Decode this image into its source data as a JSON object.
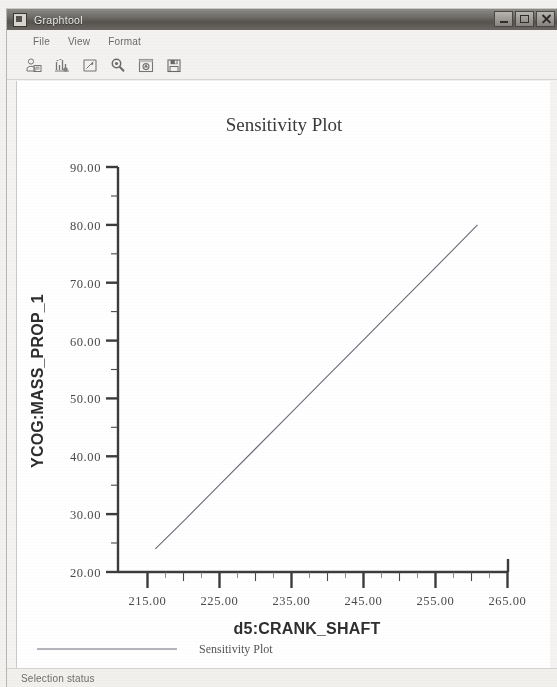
{
  "window": {
    "title": "Graphtool",
    "icon": "app-icon",
    "controls": [
      {
        "name": "minimize",
        "glyph": "minimize-icon"
      },
      {
        "name": "maximize",
        "glyph": "maximize-icon"
      },
      {
        "name": "close",
        "glyph": "close-icon"
      }
    ]
  },
  "menubar": {
    "items": [
      {
        "label": "File"
      },
      {
        "label": "View"
      },
      {
        "label": "Format"
      }
    ]
  },
  "toolbar": {
    "buttons": [
      {
        "name": "print-preview-icon",
        "tip": "Print"
      },
      {
        "name": "chart-settings-icon",
        "tip": "Chart Settings"
      },
      {
        "name": "page-icon",
        "tip": "Page"
      },
      {
        "name": "zoom-icon",
        "tip": "Zoom"
      },
      {
        "name": "snapshot-icon",
        "tip": "Snapshot"
      },
      {
        "name": "save-icon",
        "tip": "Save"
      }
    ]
  },
  "statusbar": {
    "text": "Selection status"
  },
  "chart_data": {
    "type": "line",
    "title": "Sensitivity Plot",
    "xlabel": "d5:CRANK_SHAFT",
    "ylabel": "YCOG:MASS_PROP_1",
    "xlim": [
      210,
      267.5
    ],
    "ylim": [
      20,
      90
    ],
    "xticks": [
      215,
      225,
      235,
      245,
      255,
      265
    ],
    "xticklabels": [
      "215.00",
      "225.00",
      "235.00",
      "245.00",
      "255.00",
      "265.00"
    ],
    "xminorticks": [
      220,
      230,
      240,
      250,
      260
    ],
    "yticks": [
      20,
      30,
      40,
      50,
      60,
      70,
      80,
      90
    ],
    "yticklabels": [
      "20.00",
      "30.00",
      "40.00",
      "50.00",
      "60.00",
      "70.00",
      "80.00",
      "90.00"
    ],
    "yminorticks": [
      25,
      35,
      45,
      55,
      65,
      75,
      85
    ],
    "grid": false,
    "legend_position": "below-axis",
    "series": [
      {
        "name": "Sensitivity Plot",
        "color": "#6b6b78",
        "x": [
          215.5,
          220.0,
          225.0,
          230.0,
          235.0,
          240.0,
          245.0,
          250.0,
          255.0,
          260.0,
          263.0
        ],
        "y": [
          24.0,
          29.2,
          35.1,
          41.0,
          46.9,
          52.8,
          58.7,
          64.6,
          70.5,
          76.4,
          80.0
        ]
      }
    ]
  },
  "legend": {
    "entries": [
      {
        "label": "Sensitivity Plot",
        "color": "#6b6b78"
      }
    ]
  }
}
